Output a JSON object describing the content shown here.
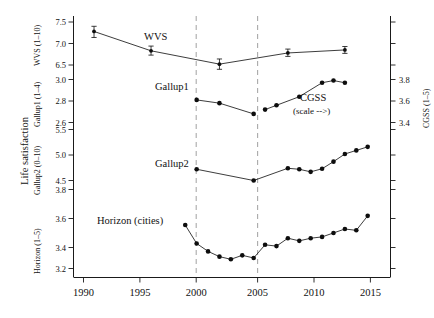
{
  "chart_data": {
    "type": "line",
    "title": "",
    "xlabel": "",
    "ylabel": "Life satisfaction",
    "xlim": [
      1988.2,
      2016.0
    ],
    "xticks": [
      1990,
      1995,
      2000,
      2005,
      2010,
      2015
    ],
    "xtick_labels": [
      "1990",
      "1995",
      "2000",
      "2005",
      "2010",
      "2015"
    ],
    "grid": false,
    "legend": "inline-annotations",
    "annotations": [
      {
        "text": "WVS",
        "x": 1996.6,
        "y_axis": "wvs"
      },
      {
        "text": "Gallup1",
        "x": 1998.0,
        "y_axis": "gallup1"
      },
      {
        "text": "CGSS",
        "x": 2009.2,
        "y_axis": "cgss"
      },
      {
        "text": "(scale -->)",
        "x": 2009.2,
        "y_axis": "cgss"
      },
      {
        "text": "Gallup2",
        "x": 2000.6,
        "y_axis": "gallup2"
      },
      {
        "text": "Horizon (cities)",
        "x": 2000.0,
        "y_axis": "horizon"
      }
    ],
    "vertical_reference_lines": [
      {
        "x": 2000,
        "style": "dashed",
        "color": "#aaaaaa"
      },
      {
        "x": 2005,
        "style": "dashed",
        "color": "#aaaaaa"
      }
    ],
    "left_axis_panels": [
      {
        "name": "wvs",
        "label": "WVS (1–10)",
        "ticks": [
          6.5,
          7.0,
          7.5
        ],
        "tick_labels": [
          "6.5",
          "7.0",
          "7.5"
        ]
      },
      {
        "name": "gallup1",
        "label": "Gallup1 (1–4)",
        "ticks": [
          2.6,
          2.8,
          3.0
        ],
        "tick_labels": [
          "2.6",
          "2.8",
          "3.0"
        ]
      },
      {
        "name": "gallup2",
        "label": "Gallup2 (0–10)",
        "ticks": [
          4.5,
          5.0,
          5.5
        ],
        "tick_labels": [
          "4.5",
          "5.0",
          "5.5"
        ]
      },
      {
        "name": "horizon",
        "label": "Horizon (1–5)",
        "ticks": [
          3.2,
          3.4,
          3.6,
          3.8
        ],
        "tick_labels": [
          "3.2",
          "3.4",
          "3.6",
          "3.8"
        ]
      }
    ],
    "right_axis": {
      "name": "cgss",
      "label": "CGSS (1–5)",
      "ticks": [
        3.4,
        3.6,
        3.8
      ],
      "tick_labels": [
        "3.4",
        "3.6",
        "3.8"
      ]
    },
    "series": [
      {
        "name": "WVS",
        "axis": "wvs",
        "has_error_bars": true,
        "x": [
          1990,
          1995,
          2001,
          2007,
          2012
        ],
        "values": [
          7.28,
          6.83,
          6.52,
          6.78,
          6.85
        ],
        "err_low": [
          7.14,
          6.73,
          6.4,
          6.7,
          6.77
        ],
        "err_high": [
          7.4,
          6.94,
          6.64,
          6.87,
          6.93
        ]
      },
      {
        "name": "Gallup1",
        "axis": "gallup1",
        "has_error_bars": false,
        "x": [
          1999,
          2001,
          2004
        ],
        "values": [
          2.81,
          2.78,
          2.68
        ]
      },
      {
        "name": "CGSS",
        "axis": "cgss",
        "has_error_bars": false,
        "x": [
          2005,
          2006,
          2008,
          2010,
          2011,
          2012
        ],
        "values": [
          3.52,
          3.56,
          3.64,
          3.77,
          3.79,
          3.77
        ]
      },
      {
        "name": "Gallup2",
        "axis": "gallup2",
        "has_error_bars": false,
        "x": [
          1999,
          2004,
          2007,
          2008,
          2009,
          2010,
          2011,
          2012,
          2013,
          2014
        ],
        "values": [
          4.72,
          4.5,
          4.74,
          4.72,
          4.67,
          4.73,
          4.87,
          5.02,
          5.09,
          5.16
        ]
      },
      {
        "name": "Horizon (cities)",
        "axis": "horizon",
        "has_error_bars": false,
        "x": [
          1998,
          1999,
          2000,
          2001,
          2002,
          2003,
          2004,
          2005,
          2006,
          2007,
          2008,
          2009,
          2010,
          2011,
          2012,
          2013,
          2014
        ],
        "values": [
          3.53,
          3.39,
          3.33,
          3.29,
          3.27,
          3.3,
          3.28,
          3.38,
          3.37,
          3.43,
          3.41,
          3.43,
          3.44,
          3.47,
          3.5,
          3.49,
          3.6
        ]
      }
    ]
  },
  "axis_labels": {
    "main_y": "Life satisfaction",
    "wvs": "WVS (1–10)",
    "gallup1": "Gallup1 (1–4)",
    "gallup2": "Gallup2 (0–10)",
    "horizon": "Horizon (1–5)",
    "cgss": "CGSS (1–5)"
  },
  "series_labels": {
    "wvs": "WVS",
    "gallup1": "Gallup1",
    "cgss": "CGSS",
    "cgss_scale_note": "(scale -->)",
    "gallup2": "Gallup2",
    "horizon": "Horizon (cities)"
  },
  "xtick_labels": {
    "t0": "1990",
    "t1": "1995",
    "t2": "2000",
    "t3": "2005",
    "t4": "2010",
    "t5": "2015"
  },
  "left_ticks": {
    "wvs": {
      "a": "7.5",
      "b": "7.0",
      "c": "6.5"
    },
    "gallup1": {
      "a": "3.0",
      "b": "2.8",
      "c": "2.6"
    },
    "gallup2": {
      "a": "5.5",
      "b": "5.0",
      "c": "4.5"
    },
    "horizon": {
      "a": "3.8",
      "b": "3.6",
      "c": "3.4",
      "d": "3.2"
    }
  },
  "right_ticks": {
    "a": "3.8",
    "b": "3.6",
    "c": "3.4"
  },
  "colors": {
    "background": "#ffffff",
    "axis": "#1a1a1a",
    "series": "#0d0d0d",
    "reference_line": "#aaaaaa"
  }
}
